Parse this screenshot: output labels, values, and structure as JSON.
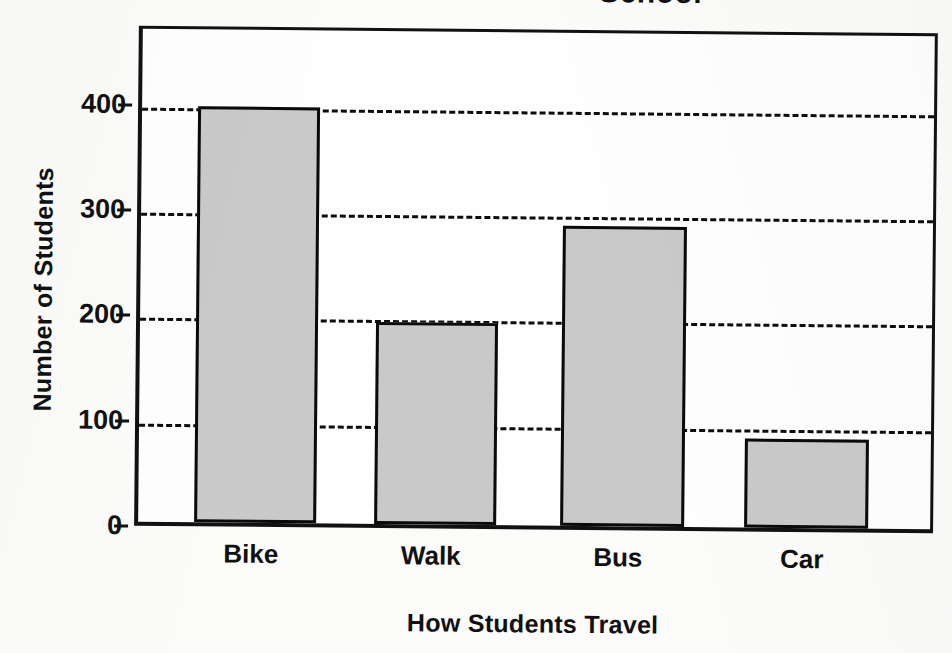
{
  "chart_data": {
    "type": "bar",
    "title": "School",
    "title_note": "cropped at top edge of image",
    "xlabel": "How Students Travel",
    "ylabel": "Number of Students",
    "categories": [
      "Bike",
      "Walk",
      "Bus",
      "Car"
    ],
    "values": [
      395,
      192,
      285,
      85
    ],
    "ylim": [
      0,
      475
    ],
    "yticks": [
      0,
      100,
      200,
      300,
      400
    ],
    "ytick_labels": [
      "0",
      "100",
      "200",
      "300",
      "400"
    ],
    "grid": true,
    "grid_style": "dashed-horizontal",
    "legend": null,
    "bar_fill": "#c9c9c9",
    "bar_edge": "#0a0a0a",
    "axis_color": "#111111",
    "background": "#fefefe"
  }
}
